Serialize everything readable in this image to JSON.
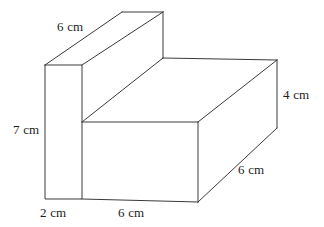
{
  "figure": {
    "type": "3d-solid-orthographic-sketch",
    "stroke_color": "#3a3a3a",
    "background_color": "#ffffff",
    "unit": "cm",
    "labels": [
      {
        "id": "top-back-length",
        "text": "6 cm",
        "x": 57,
        "y": 20
      },
      {
        "id": "left-height",
        "text": "7 cm",
        "x": 13,
        "y": 123
      },
      {
        "id": "right-height",
        "text": "4 cm",
        "x": 283,
        "y": 88
      },
      {
        "id": "right-depth",
        "text": "6 cm",
        "x": 238,
        "y": 163
      },
      {
        "id": "bottom-left-width",
        "text": "2 cm",
        "x": 40,
        "y": 206
      },
      {
        "id": "bottom-front-width",
        "text": "6 cm",
        "x": 118,
        "y": 206
      }
    ],
    "vertices": {
      "front_left_bottom": [
        45,
        199
      ],
      "front_left_top": [
        45,
        65
      ],
      "notch_bottom": [
        82,
        199
      ],
      "notch_inner": [
        82,
        122
      ],
      "slab_top_front_left": [
        82,
        65
      ],
      "slab_top_back_left": [
        122,
        12
      ],
      "slab_top_back_right": [
        163,
        12
      ],
      "step_vertex": [
        163,
        58
      ],
      "top_face_back_right": [
        277,
        60
      ],
      "top_face_front_right": [
        198,
        122
      ],
      "front_bottom_right": [
        198,
        202
      ],
      "right_bottom_back": [
        277,
        128
      ]
    }
  }
}
